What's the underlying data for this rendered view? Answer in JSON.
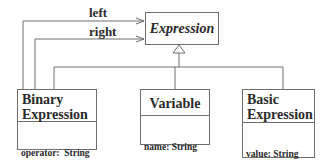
{
  "diagram": {
    "type": "UML class diagram",
    "abstract_class": {
      "name": "Expression",
      "italic": true
    },
    "classes": [
      {
        "id": "binary",
        "name_lines": [
          "Binary",
          "Expression"
        ],
        "attributes": [
          "operator:  String"
        ]
      },
      {
        "id": "variable",
        "name_lines": [
          "Variable"
        ],
        "attributes": [
          "name: String"
        ]
      },
      {
        "id": "basic",
        "name_lines": [
          "Basic",
          "Expression"
        ],
        "attributes": [
          "value: String",
          "type: integer"
        ]
      }
    ],
    "associations": [
      {
        "from": "Binary Expression",
        "to": "Expression",
        "label": "left"
      },
      {
        "from": "Binary Expression",
        "to": "Expression",
        "label": "right"
      }
    ],
    "generalization": {
      "parent": "Expression",
      "children": [
        "Binary Expression",
        "Variable",
        "Basic Expression"
      ]
    },
    "colors": {
      "line": "#6e6e6e",
      "text": "#2a2a2a",
      "background": "#ffffff"
    }
  }
}
